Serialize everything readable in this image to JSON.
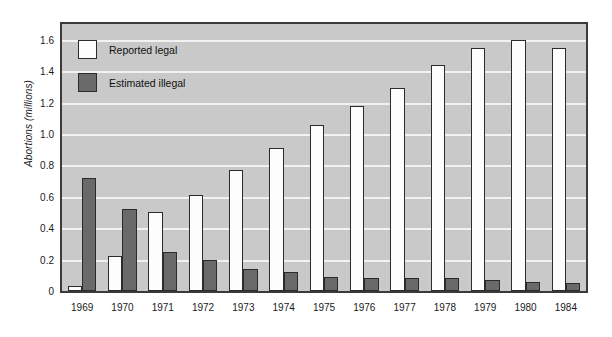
{
  "chart_data": {
    "type": "bar",
    "title": "",
    "subtitle": "",
    "xlabel": "",
    "ylabel": "Abortions (millions)",
    "ylim": [
      0,
      1.7
    ],
    "yticks": [
      "0",
      "0.2",
      "0.4",
      "0.6",
      "0.8",
      "1.0",
      "1.2",
      "1.4",
      "1.6"
    ],
    "ytick_values": [
      0,
      0.2,
      0.4,
      0.6,
      0.8,
      1.0,
      1.2,
      1.4,
      1.6
    ],
    "grid": true,
    "legend_position": "upper-left",
    "categories": [
      "1969",
      "1970",
      "1971",
      "1972",
      "1973",
      "1974",
      "1975",
      "1976",
      "1977",
      "1978",
      "1979",
      "1980",
      "1984"
    ],
    "series": [
      {
        "name": "Reported legal",
        "color": "#fdfdfd",
        "values": [
          0.03,
          0.22,
          0.5,
          0.61,
          0.77,
          0.91,
          1.06,
          1.18,
          1.29,
          1.44,
          1.55,
          1.6,
          1.55
        ]
      },
      {
        "name": "Estimated illegal",
        "color": "#6a6a6a",
        "values": [
          0.72,
          0.52,
          0.25,
          0.2,
          0.14,
          0.12,
          0.09,
          0.08,
          0.08,
          0.08,
          0.07,
          0.06,
          0.05
        ]
      }
    ]
  },
  "colors": {
    "plot_background": "#c9c9c9",
    "gridline": "#f2f2f2",
    "axis_border": "#3a3a3a",
    "bar_outline": "#2b2b2b",
    "legal_fill": "#fdfdfd",
    "illegal_fill": "#6a6a6a",
    "text": "#1a1a1a"
  }
}
